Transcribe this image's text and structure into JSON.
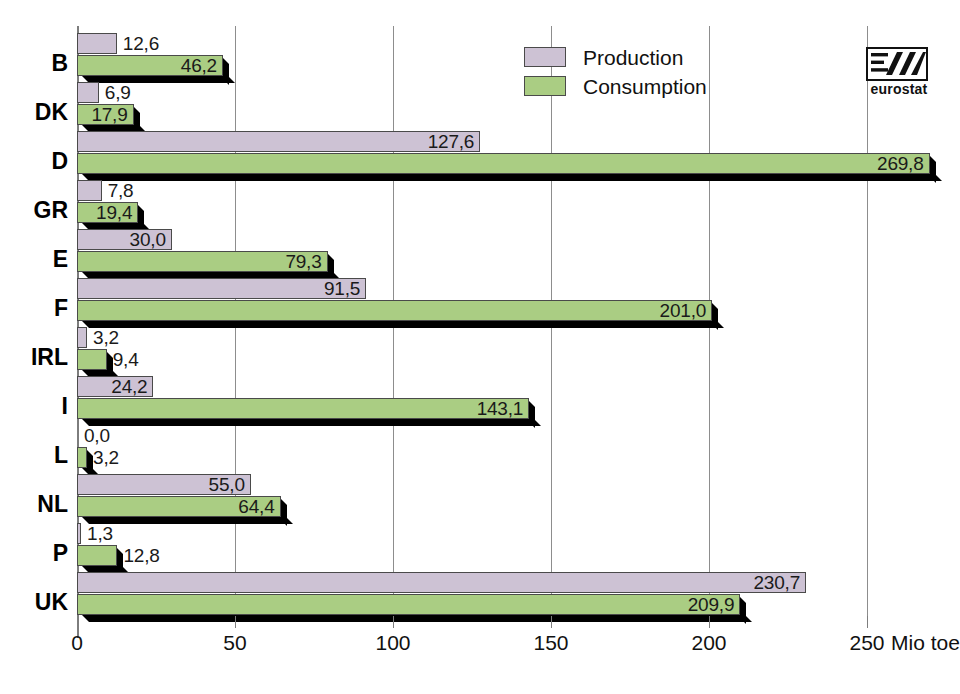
{
  "chart_data": {
    "type": "bar",
    "orientation": "horizontal",
    "title": "",
    "xlabel": "Mio toe",
    "ylabel": "",
    "xlim": [
      0,
      275
    ],
    "xticks": [
      0,
      50,
      100,
      150,
      200,
      250
    ],
    "xtick_labels": [
      "0",
      "50",
      "100",
      "150",
      "200",
      "250"
    ],
    "unit_label": "Mio toe",
    "grid": true,
    "grid_axis": "x",
    "decimal_separator": ",",
    "legend_position": "top-center",
    "categories": [
      "B",
      "DK",
      "D",
      "GR",
      "E",
      "F",
      "IRL",
      "I",
      "L",
      "NL",
      "P",
      "UK"
    ],
    "series": [
      {
        "name": "Production",
        "color": "#cdc2d4",
        "values": [
          12.6,
          6.9,
          127.6,
          7.8,
          30.0,
          91.5,
          3.2,
          24.2,
          0.0,
          55.0,
          1.3,
          230.7
        ],
        "labels": [
          "12,6",
          "6,9",
          "127,6",
          "7,8",
          "30,0",
          "91,5",
          "3,2",
          "24,2",
          "0,0",
          "55,0",
          "1,3",
          "230,7"
        ]
      },
      {
        "name": "Consumption",
        "color": "#aacd83",
        "values": [
          46.2,
          17.9,
          269.8,
          19.4,
          79.3,
          201.0,
          9.4,
          143.1,
          3.2,
          64.4,
          12.8,
          209.9
        ],
        "labels": [
          "46,2",
          "17,9",
          "269,8",
          "19,4",
          "79,3",
          "201,0",
          "9,4",
          "143,1",
          "3,2",
          "64,4",
          "12,8",
          "209,9"
        ]
      }
    ]
  },
  "legend": {
    "items": [
      {
        "label": "Production",
        "color": "#cdc2d4"
      },
      {
        "label": "Consumption",
        "color": "#aacd83"
      }
    ]
  },
  "logo": {
    "name": "eurostat",
    "caption": "eurostat"
  },
  "axis": {
    "unit": "Mio toe"
  }
}
